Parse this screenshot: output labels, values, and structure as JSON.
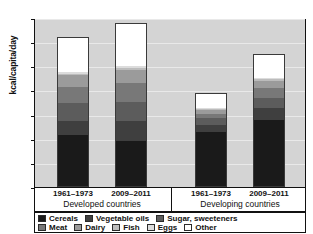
{
  "chart_data": {
    "type": "bar",
    "title": "",
    "xlabel": "",
    "ylabel": "kcal/capita/day",
    "ylim": [
      0,
      3500
    ],
    "ytick_labels": [
      "0",
      "500",
      "1000",
      "1500",
      "2000",
      "2500",
      "3000",
      "3500"
    ],
    "ytick_values": [
      0,
      500,
      1000,
      1500,
      2000,
      2500,
      3000,
      3500
    ],
    "grid": true,
    "stacked": true,
    "legend_position": "bottom",
    "groups": [
      {
        "label": "Developed countries",
        "categories": [
          "1961–1973",
          "2009–2011"
        ]
      },
      {
        "label": "Developing countries",
        "categories": [
          "1961–1973",
          "2009–2011"
        ]
      }
    ],
    "categories": [
      "1961–1973",
      "2009–2011",
      "1961–1973",
      "2009–2011"
    ],
    "series": [
      {
        "name": "Cereals",
        "color": "#1a1a1a",
        "values": [
          1060,
          950,
          1150,
          1390
        ]
      },
      {
        "name": "Vegetable oils",
        "color": "#3f3f3f",
        "values": [
          300,
          420,
          130,
          250
        ]
      },
      {
        "name": "Sugar, sweeteners",
        "color": "#5c5c5c",
        "values": [
          390,
          400,
          150,
          220
        ]
      },
      {
        "name": "Meat",
        "color": "#787878",
        "values": [
          320,
          380,
          90,
          200
        ]
      },
      {
        "name": "Dairy",
        "color": "#9b9b9b",
        "values": [
          250,
          280,
          90,
          150
        ]
      },
      {
        "name": "Fish",
        "color": "#bcbcbc",
        "values": [
          30,
          40,
          20,
          30
        ]
      },
      {
        "name": "Eggs",
        "color": "#dcdcdc",
        "values": [
          40,
          50,
          20,
          40
        ]
      },
      {
        "name": "Other",
        "color": "#ffffff",
        "values": [
          710,
          880,
          300,
          470
        ]
      }
    ],
    "totals": [
      3100,
      3400,
      1950,
      2750
    ]
  },
  "legend": {
    "row1": [
      {
        "label": "Cereals",
        "color": "#1a1a1a"
      },
      {
        "label": "Vegetable oils",
        "color": "#3f3f3f"
      },
      {
        "label": "Sugar, sweeteners",
        "color": "#5c5c5c"
      }
    ],
    "row2": [
      {
        "label": "Meat",
        "color": "#787878"
      },
      {
        "label": "Dairy",
        "color": "#9b9b9b"
      },
      {
        "label": "Fish",
        "color": "#bcbcbc"
      },
      {
        "label": "Eggs",
        "color": "#dcdcdc"
      },
      {
        "label": "Other",
        "color": "#ffffff"
      }
    ]
  }
}
